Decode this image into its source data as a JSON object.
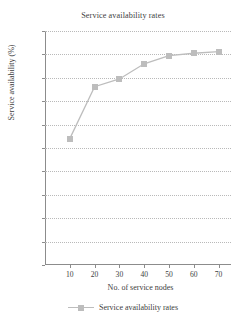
{
  "chart_data": {
    "type": "line",
    "title": "Service availability rates",
    "xlabel": "No. of service nodes",
    "ylabel": "Service availability (%)",
    "x": [
      10,
      20,
      30,
      40,
      50,
      60,
      70
    ],
    "values": [
      0.54,
      0.762,
      0.795,
      0.86,
      0.895,
      0.905,
      0.912
    ],
    "series": [
      {
        "name": "Service availability rates",
        "values": [
          0.54,
          0.762,
          0.795,
          0.86,
          0.895,
          0.905,
          0.912
        ]
      }
    ],
    "xlim": [
      0,
      75
    ],
    "ylim": [
      0,
      1
    ],
    "xticks": [
      "10",
      "20",
      "30",
      "40",
      "50",
      "60",
      "70"
    ],
    "yticks": [
      "0",
      "0.1",
      "0.2",
      "0.3",
      "0.4",
      "0.5",
      "0.6",
      "0.7",
      "0.8",
      "0.9",
      "1"
    ],
    "grid": "horizontal-dotted",
    "legend_position": "bottom",
    "marker": "square",
    "colors": {
      "series": "#bdbdbd",
      "axis": "#8c8c8c",
      "grid": "#b9b9b9",
      "text": "#404040",
      "background": "#ffffff"
    }
  },
  "legend": {
    "entries": [
      {
        "label": "Service availability rates",
        "marker_icon": "square-marker-icon"
      }
    ]
  }
}
